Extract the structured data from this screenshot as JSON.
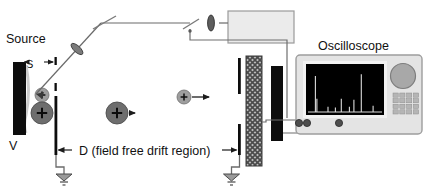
{
  "figure": {
    "type": "instrument-schematic"
  },
  "labels": {
    "source": "Source",
    "extraction_gap": "S",
    "source_voltage": "V",
    "drift_region": "D (field free drift region)",
    "laser": "Laser",
    "oscilloscope": "Oscilloscope"
  },
  "components": {
    "source_plate": {
      "name": "source-plate",
      "fill": "#0d0d0d"
    },
    "extraction_grid": {
      "name": "extraction-grid",
      "fill": "#0d0d0d"
    },
    "drift_entrance_plate": {
      "name": "drift-entrance-plate",
      "fill": "#0d0d0d"
    },
    "drift_exit_plate": {
      "name": "drift-exit-plate",
      "fill": "#0d0d0d"
    },
    "reflector_grid": {
      "name": "reflector-grid-hatched",
      "fill": "#8a8a8a"
    },
    "detector": {
      "name": "detector-plate",
      "fill": "#0d0d0d"
    },
    "ground_symbols": 2,
    "mirrors": 2,
    "lenses": 2
  },
  "ions": [
    {
      "name": "ion-in-source-small",
      "charge": "+",
      "radius": 7
    },
    {
      "name": "ion-in-source-large",
      "charge": "+",
      "radius": 11
    },
    {
      "name": "ion-drift-heavy",
      "charge": "+",
      "radius": 11
    },
    {
      "name": "ion-drift-light",
      "charge": "+",
      "radius": 7
    }
  ],
  "oscilloscope": {
    "screen_bg": "#000000",
    "trace_color": "#dcdcdc",
    "body_fill": "#e6e6e6",
    "knob_fill": "#a8a8a8",
    "button_rows": 4,
    "button_cols": 4,
    "ports": 3,
    "spectrum": {
      "type": "line",
      "xlabel": "",
      "ylabel": "",
      "peaks": [
        {
          "x": 10,
          "height": 82
        },
        {
          "x": 12,
          "height": 30
        },
        {
          "x": 27,
          "height": 12
        },
        {
          "x": 37,
          "height": 10
        },
        {
          "x": 45,
          "height": 30
        },
        {
          "x": 56,
          "height": 12
        },
        {
          "x": 62,
          "height": 28
        },
        {
          "x": 72,
          "height": 86
        },
        {
          "x": 88,
          "height": 14
        }
      ]
    }
  },
  "colors": {
    "line": "#444444",
    "wire": "#555555",
    "ion_dark": "#6e6e6e",
    "ion_light": "#9e9e9e",
    "text": "#111111"
  }
}
